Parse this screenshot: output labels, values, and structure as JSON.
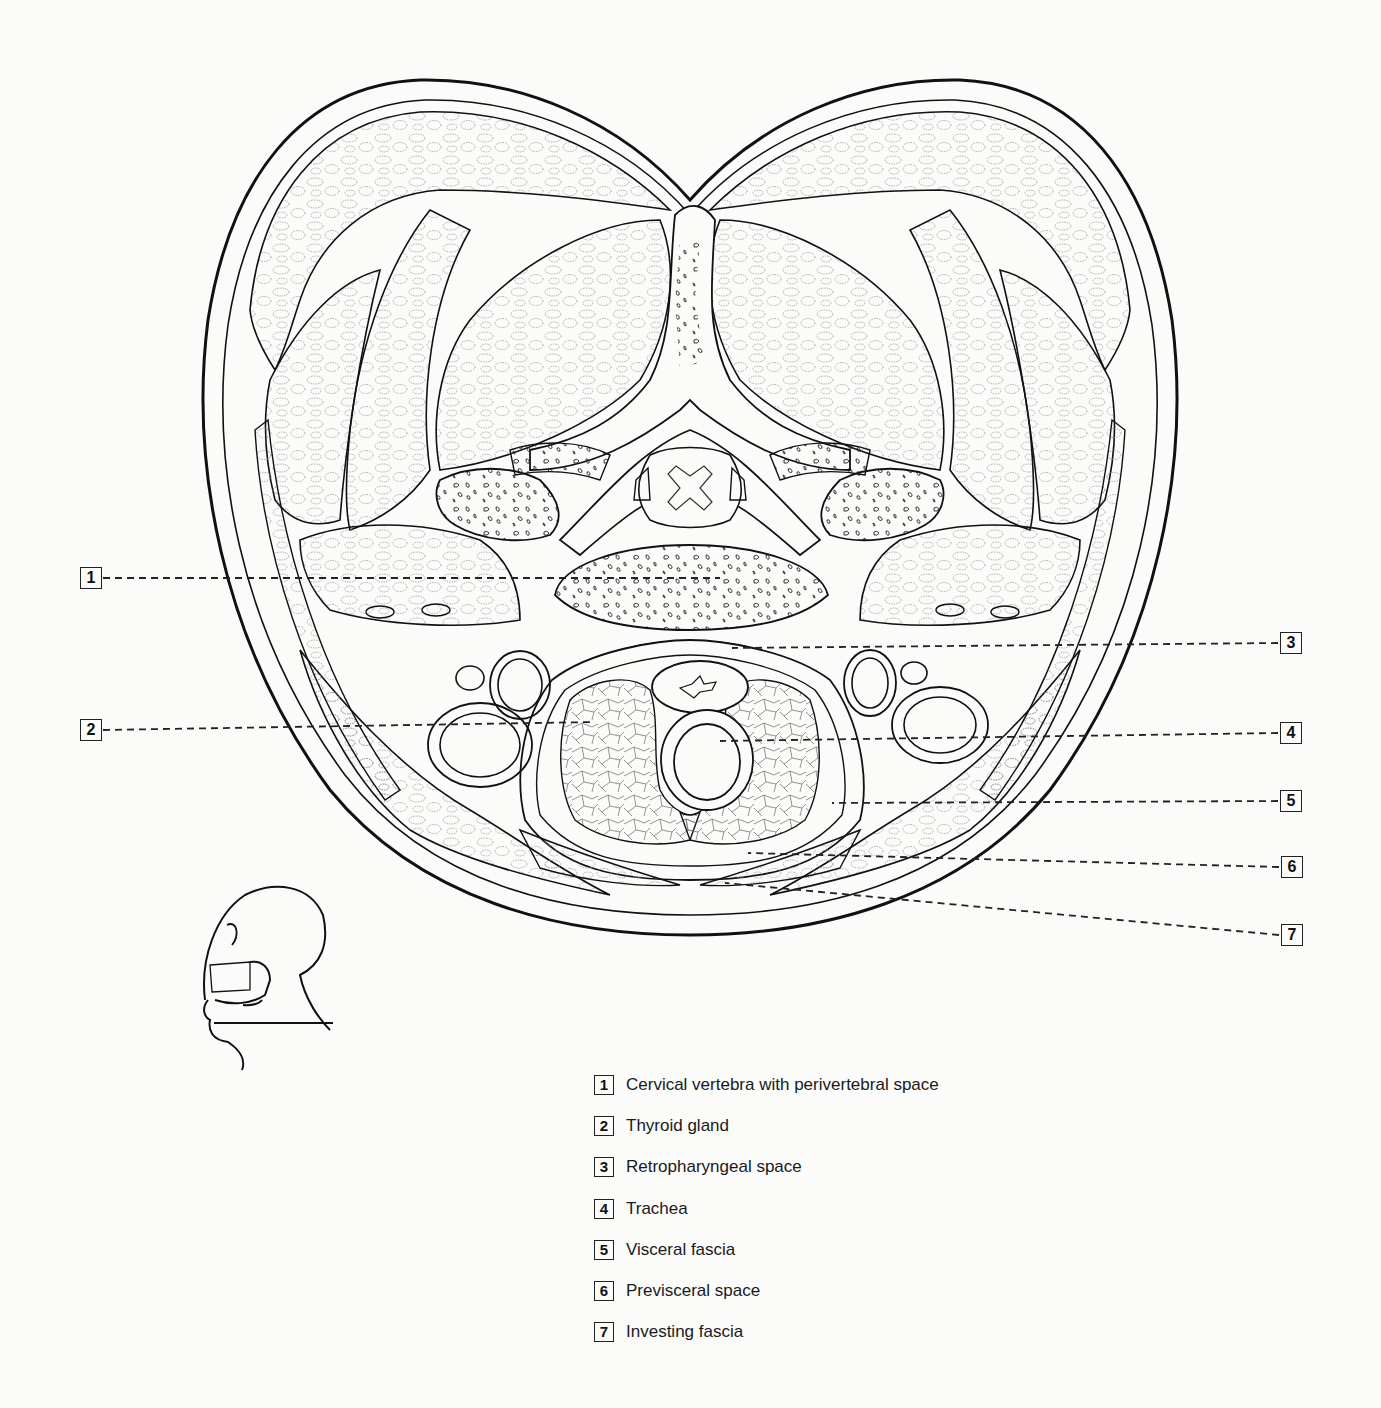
{
  "figure": {
    "orientation_inset": "head-profile-icon-with-section-line",
    "colors": {
      "line": "#111111",
      "background": "#fbfbfa",
      "muscle_texture": "#9a9a9a"
    }
  },
  "callouts": [
    {
      "num": "1",
      "side": "left",
      "x": 80,
      "y": 567
    },
    {
      "num": "2",
      "side": "left",
      "x": 80,
      "y": 719
    },
    {
      "num": "3",
      "side": "right",
      "x": 1280,
      "y": 632
    },
    {
      "num": "4",
      "side": "right",
      "x": 1280,
      "y": 722
    },
    {
      "num": "5",
      "side": "right",
      "x": 1280,
      "y": 790
    },
    {
      "num": "6",
      "side": "right",
      "x": 1281,
      "y": 856
    },
    {
      "num": "7",
      "side": "right",
      "x": 1281,
      "y": 924
    }
  ],
  "legend": [
    {
      "num": "1",
      "label": "Cervical vertebra with perivertebral space"
    },
    {
      "num": "2",
      "label": "Thyroid gland"
    },
    {
      "num": "3",
      "label": "Retropharyngeal space"
    },
    {
      "num": "4",
      "label": "Trachea"
    },
    {
      "num": "5",
      "label": "Visceral fascia"
    },
    {
      "num": "6",
      "label": "Previsceral space"
    },
    {
      "num": "7",
      "label": "Investing fascia"
    }
  ]
}
